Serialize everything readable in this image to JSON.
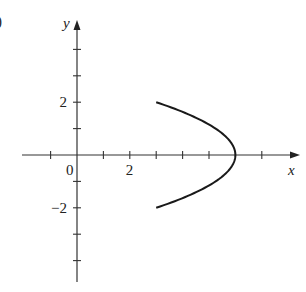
{
  "panel_label": ")",
  "chart_data": {
    "type": "line",
    "title": "",
    "xlabel": "x",
    "ylabel": "y",
    "xlim": [
      -1.5,
      8.5
    ],
    "ylim": [
      -5.0,
      4.5
    ],
    "grid": false,
    "legend": null,
    "x_ticks": [
      -1,
      1,
      2,
      3,
      4,
      5,
      6,
      7
    ],
    "y_ticks": [
      -4,
      -3,
      -2,
      -1,
      1,
      2,
      3,
      4
    ],
    "x_tick_labels": [
      {
        "value": 0,
        "label": "0"
      },
      {
        "value": 2,
        "label": "2"
      }
    ],
    "y_tick_labels": [
      {
        "value": 2,
        "label": "2"
      },
      {
        "value": -2,
        "label": "−2"
      }
    ],
    "series": [
      {
        "name": "curve",
        "description": "left-opening parabola x = 6 - 0.75*y^2 for -2 <= y <= 2",
        "points": [
          {
            "x": 3.0,
            "y": 2.0
          },
          {
            "x": 4.3125,
            "y": 1.5
          },
          {
            "x": 5.25,
            "y": 1.0
          },
          {
            "x": 5.8125,
            "y": 0.5
          },
          {
            "x": 6.0,
            "y": 0.0
          },
          {
            "x": 5.8125,
            "y": -0.5
          },
          {
            "x": 5.25,
            "y": -1.0
          },
          {
            "x": 4.3125,
            "y": -1.5
          },
          {
            "x": 3.0,
            "y": -2.0
          }
        ]
      }
    ]
  },
  "layout": {
    "origin_px": [
      77,
      155
    ],
    "unit_px": 26.4,
    "x_axis_px": [
      22,
      300
    ],
    "y_axis_px": [
      282,
      20
    ]
  }
}
